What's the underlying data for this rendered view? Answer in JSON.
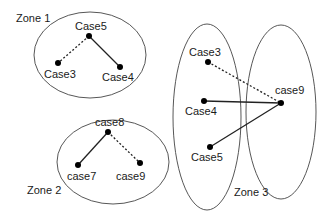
{
  "zones": {
    "zone1": {
      "label": "Zone 1",
      "nodes": {
        "case5": "Case5",
        "case3": "Case3",
        "case4": "Case4"
      },
      "edges": [
        {
          "from": "Case5",
          "to": "Case3",
          "style": "dashed"
        },
        {
          "from": "Case5",
          "to": "Case4",
          "style": "solid"
        }
      ]
    },
    "zone2": {
      "label": "Zone 2",
      "nodes": {
        "case8": "case8",
        "case7": "case7",
        "case9": "case9"
      },
      "edges": [
        {
          "from": "case8",
          "to": "case7",
          "style": "solid"
        },
        {
          "from": "case8",
          "to": "case9",
          "style": "dashed"
        }
      ]
    },
    "zone3": {
      "label": "Zone 3",
      "nodes": {
        "case3": "Case3",
        "case4": "Case4",
        "case5": "Case5",
        "case9": "case9"
      },
      "edges": [
        {
          "from": "Case3",
          "to": "case9",
          "style": "dashed"
        },
        {
          "from": "Case4",
          "to": "case9",
          "style": "solid"
        },
        {
          "from": "Case5",
          "to": "case9",
          "style": "solid"
        }
      ]
    }
  },
  "colors": {
    "stroke": "#333333",
    "node": "#000000",
    "background": "#ffffff"
  }
}
